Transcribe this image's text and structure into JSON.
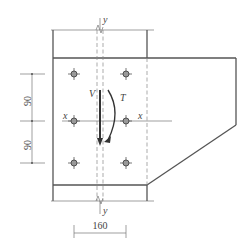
{
  "diagram": {
    "type": "steel-connection-detail",
    "axis_labels": {
      "y_top": "y",
      "y_bottom": "y",
      "x_left": "x",
      "x_right": "x"
    },
    "force_labels": {
      "shear": "V",
      "torsion": "T"
    },
    "dimensions": {
      "vertical_upper": "90",
      "vertical_lower": "90",
      "horizontal": "160"
    },
    "bolt_count": 6,
    "colors": {
      "line": "#555555",
      "background": "#ffffff"
    }
  }
}
